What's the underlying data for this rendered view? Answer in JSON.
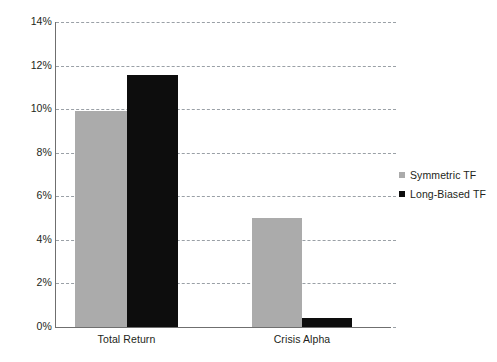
{
  "chart_data": {
    "type": "bar",
    "title": "",
    "xlabel": "",
    "ylabel": "",
    "categories": [
      "Total Return",
      "Crisis Alpha"
    ],
    "series": [
      {
        "name": "Symmetric TF",
        "color": "#ababab",
        "values": [
          9.9,
          5.0
        ]
      },
      {
        "name": "Long-Biased TF",
        "color": "#0d0d0d",
        "values": [
          11.55,
          0.4
        ]
      }
    ],
    "ylim": [
      0,
      14
    ],
    "ytick_values": [
      0,
      2,
      4,
      6,
      8,
      10,
      12,
      14
    ],
    "ytick_labels": [
      "0%",
      "2%",
      "4%",
      "6%",
      "8%",
      "10%",
      "12%",
      "14%"
    ],
    "grid": true,
    "grid_style": "dashed",
    "grid_axis": "y",
    "legend_position": "right",
    "value_suffix": "%"
  },
  "legend": {
    "entries": [
      {
        "label": "Symmetric TF",
        "marker": "square-swatch-gray"
      },
      {
        "label": "Long-Biased TF",
        "marker": "square-swatch-black"
      }
    ]
  },
  "colors": {
    "symmetric": "#ababab",
    "long_biased": "#0d0d0d",
    "gridline": "#9aa0a6",
    "axis": "#6f6f6f",
    "text": "#231f20",
    "background": "#ffffff"
  }
}
